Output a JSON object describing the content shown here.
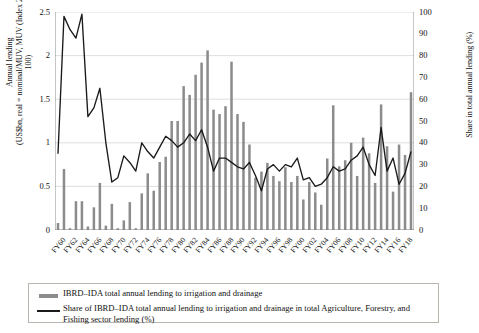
{
  "chart_data": {
    "type": "bar",
    "title": "",
    "xlabel": "",
    "ylabel": "Annual lending (US$bn, real = nominal/MUV, MUV (Index 2010 = 100)",
    "ylabel_line1": "Annual lending",
    "ylabel_line2": "(US$bn, real = nominal/MUV, MUV (Index 2010 = 100)",
    "y2label": "Share in total annual lending (%)",
    "ylim": [
      0,
      2.5
    ],
    "y2lim": [
      0,
      100
    ],
    "yticks": [
      "0",
      "0.5",
      "1",
      "1.5",
      "2",
      "2.5"
    ],
    "ytick_values": [
      0,
      0.5,
      1,
      1.5,
      2,
      2.5
    ],
    "y2ticks": [
      "0",
      "10",
      "20",
      "30",
      "40",
      "50",
      "60",
      "70",
      "80",
      "90",
      "100"
    ],
    "y2tick_values": [
      0,
      10,
      20,
      30,
      40,
      50,
      60,
      70,
      80,
      90,
      100
    ],
    "grid": true,
    "legend_position": "below-plot",
    "categories": [
      "FY59",
      "FY60",
      "FY61",
      "FY62",
      "FY63",
      "FY64",
      "FY65",
      "FY66",
      "FY67",
      "FY68",
      "FY69",
      "FY70",
      "FY71",
      "FY72",
      "FY73",
      "FY74",
      "FY75",
      "FY76",
      "FY77",
      "FY78",
      "FY79",
      "FY80",
      "FY81",
      "FY82",
      "FY83",
      "FY84",
      "FY85",
      "FY86",
      "FY87",
      "FY88",
      "FY89",
      "FY90",
      "FY91",
      "FY92",
      "FY93",
      "FY94",
      "FY95",
      "FY96",
      "FY97",
      "FY98",
      "FY99",
      "FY00",
      "FY01",
      "FY02",
      "FY03",
      "FY04",
      "FY05",
      "FY06",
      "FY07",
      "FY08",
      "FY09",
      "FY10",
      "FY11",
      "FY12",
      "FY13",
      "FY14",
      "FY15",
      "FY16",
      "FY17",
      "FY18"
    ],
    "xtick_labels": [
      "FY60",
      "FY62",
      "FY64",
      "FY66",
      "FY68",
      "FY70",
      "FY72",
      "FY74",
      "FY76",
      "FY78",
      "FY80",
      "FY82",
      "FY84",
      "FY86",
      "FY88",
      "FY90",
      "FY92",
      "FY94",
      "FY96",
      "FY98",
      "FY00",
      "FY02",
      "FY04",
      "FY06",
      "FY08",
      "FY10",
      "FY12",
      "FY14",
      "FY16",
      "FY18"
    ],
    "series": [
      {
        "name": "IBRD–IDA total annual lending to irrigation and drainage",
        "type": "bar",
        "axis": "left",
        "unit": "US$bn (real)",
        "color": "#8c8c8c",
        "values": [
          0.08,
          0.7,
          0.02,
          0.33,
          0.33,
          0.04,
          0.26,
          0.54,
          0.05,
          0.3,
          0.02,
          0.11,
          0.32,
          0.02,
          0.42,
          0.65,
          0.45,
          0.78,
          0.84,
          1.25,
          1.25,
          1.65,
          1.55,
          1.78,
          1.92,
          2.06,
          1.38,
          1.33,
          1.42,
          1.93,
          1.33,
          1.24,
          0.98,
          0.6,
          0.67,
          0.77,
          0.62,
          0.56,
          0.72,
          0.55,
          0.62,
          0.35,
          0.55,
          0.43,
          0.29,
          0.82,
          1.43,
          0.73,
          0.8,
          1.0,
          0.62,
          1.06,
          0.88,
          0.54,
          1.44,
          0.96,
          0.44,
          0.98,
          0.86,
          1.58
        ]
      },
      {
        "name": "Share of IBRD–IDA total annual lending to irrigation and drainage in total Agriculture, Forestry, and Fishing sector lending (%)",
        "type": "line",
        "axis": "right",
        "unit": "%",
        "color": "#1a1a1a",
        "values": [
          35,
          98,
          92,
          88,
          99,
          52,
          56,
          65,
          40,
          22,
          24,
          34,
          31,
          27,
          40,
          36,
          33,
          38,
          43,
          41,
          38,
          40,
          44,
          41,
          46,
          38,
          27,
          33,
          33,
          31,
          29,
          28,
          31,
          25,
          18,
          28,
          30,
          27,
          30,
          29,
          33,
          23,
          24,
          20,
          21,
          24,
          29,
          27,
          28,
          32,
          34,
          38,
          30,
          25,
          47,
          27,
          33,
          21,
          26,
          36
        ]
      }
    ]
  },
  "legend": {
    "items": [
      {
        "key": "bar",
        "label": "IBRD–IDA total annual lending to irrigation and drainage"
      },
      {
        "key": "line",
        "label": "Share of IBRD–IDA total annual lending to irrigation and drainage in total Agriculture, Forestry, and Fishing sector lending (%)"
      }
    ]
  },
  "colors": {
    "bar": "#8c8c8c",
    "line": "#1a1a1a",
    "grid": "#d6d6d6",
    "axis": "#808080",
    "legend_border": "#b9b4ae",
    "background": "#ffffff"
  }
}
